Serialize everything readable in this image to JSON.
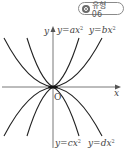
{
  "badge": {
    "icon": "target-circle-icon",
    "label": "유형 06"
  },
  "axes": {
    "x_label": "x",
    "y_label": "y",
    "origin_label": "O"
  },
  "curves": [
    {
      "name": "y=ax²",
      "label_parts": [
        "y",
        "=",
        "ax",
        "2"
      ],
      "opens": "up",
      "relative_width": "narrow"
    },
    {
      "name": "y=bx²",
      "label_parts": [
        "y",
        "=",
        "bx",
        "2"
      ],
      "opens": "up",
      "relative_width": "wide"
    },
    {
      "name": "y=cx²",
      "label_parts": [
        "y",
        "=",
        "cx",
        "2"
      ],
      "opens": "down",
      "relative_width": "narrow"
    },
    {
      "name": "y=dx²",
      "label_parts": [
        "y",
        "=",
        "dx",
        "2"
      ],
      "opens": "down",
      "relative_width": "wide"
    }
  ],
  "colors": {
    "curve": "#222222",
    "axis": "#555555",
    "label": "#444444",
    "badge_border": "#8a8a8a"
  }
}
